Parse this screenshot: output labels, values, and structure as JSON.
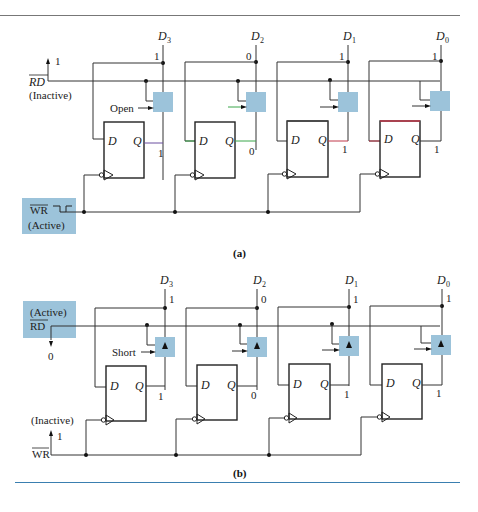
{
  "figure": {
    "colors": {
      "tri_state_buffer": "#9cc3da",
      "wr_box": "#9cc3da",
      "rule_top": "#777777",
      "rule_bottom": "#3a7fb0",
      "wire_green": "#3aa64a",
      "wire_purple": "#6a4fa0",
      "wire_red": "#c0384a"
    },
    "panel_a": {
      "caption": "(a)",
      "data_lines": [
        {
          "name": "D",
          "sub": "3",
          "level": "1",
          "q": "1",
          "buffer_note": "Open"
        },
        {
          "name": "D",
          "sub": "2",
          "level": "0",
          "q": "0",
          "buffer_note": ""
        },
        {
          "name": "D",
          "sub": "1",
          "level": "1",
          "q": "1",
          "buffer_note": ""
        },
        {
          "name": "D",
          "sub": "0",
          "level": "1",
          "q": "1",
          "buffer_note": ""
        }
      ],
      "rd": {
        "label": "RD",
        "state": "(Inactive)",
        "level": "1"
      },
      "wr": {
        "label": "WR",
        "state": "(Active)"
      },
      "ff_labels": {
        "d": "D",
        "q": "Q"
      }
    },
    "panel_b": {
      "caption": "(b)",
      "data_lines": [
        {
          "name": "D",
          "sub": "3",
          "level": "1",
          "q": "1",
          "buffer_note": "Short"
        },
        {
          "name": "D",
          "sub": "2",
          "level": "0",
          "q": "0",
          "buffer_note": ""
        },
        {
          "name": "D",
          "sub": "1",
          "level": "1",
          "q": "1",
          "buffer_note": ""
        },
        {
          "name": "D",
          "sub": "0",
          "level": "1",
          "q": "1",
          "buffer_note": ""
        }
      ],
      "rd": {
        "label": "RD",
        "state": "(Active)",
        "level": "0"
      },
      "wr": {
        "label": "WR",
        "state": "(Inactive)",
        "level": "1"
      },
      "ff_labels": {
        "d": "D",
        "q": "Q"
      }
    }
  }
}
